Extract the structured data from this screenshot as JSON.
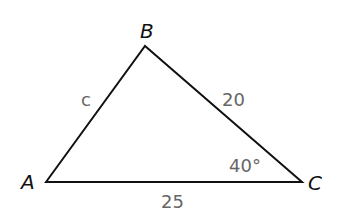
{
  "diagram": {
    "type": "triangle",
    "vertices": {
      "A": {
        "label": "A",
        "x": 46,
        "y": 182
      },
      "B": {
        "label": "B",
        "x": 145,
        "y": 46
      },
      "C": {
        "label": "C",
        "x": 302,
        "y": 182
      }
    },
    "sides": {
      "AB": {
        "label": "c"
      },
      "BC": {
        "label": "20"
      },
      "AC": {
        "label": "25"
      }
    },
    "angles": {
      "C": {
        "label": "40°"
      }
    },
    "colors": {
      "stroke": "#111111",
      "measure_text": "#666666",
      "vertex_text": "#111111"
    }
  }
}
